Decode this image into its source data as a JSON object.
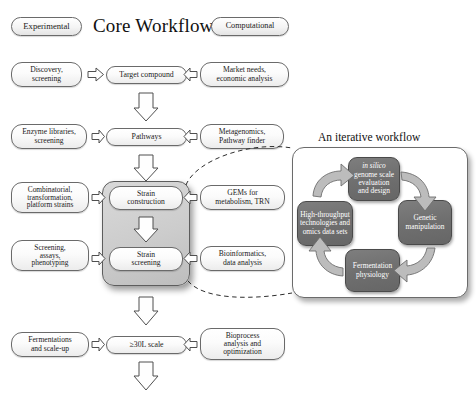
{
  "header": {
    "title": "Core Workflow",
    "left_badge": "Experimental",
    "right_badge": "Computational"
  },
  "panel": {
    "title": "An iterative workflow"
  },
  "rows": [
    {
      "left": "Discovery,\nscreening",
      "center": "Target compound",
      "right": "Market needs,\neconomic analysis"
    },
    {
      "left": "Enzyme libraries,\nscreening",
      "center": "Pathways",
      "right": "Metagenomics,\nPathway finder"
    },
    {
      "left": "Combinatorial,\ntransformation,\nplatform strains",
      "center": "Strain\nconstruction",
      "right": "GEMs for\nmetabolism, TRN"
    },
    {
      "left": "Screening,\nassays,\nphenotyping",
      "center": "Strain\nscreening",
      "right": "Bioinformatics,\ndata analysis"
    },
    {
      "left": "Fermentations\nand scale-up",
      "center": "≥30L scale",
      "right": "Bioprocess\nanalysis and\noptimization"
    }
  ],
  "cycle": {
    "top": "in silico\ngenome scale\nevaluation\nand design",
    "top_italic_prefix": "in silico",
    "right": "Genetic\nmanipulation",
    "bottom": "Fermentation\nphysiology",
    "left": "High-throughput\ntechnologies and\nomics data sets"
  },
  "colors": {
    "node_fill": "#ffffff",
    "node_stroke": "#6a6a6a",
    "grey_container": "#cccccc",
    "cycle_node": "#6f6f6f",
    "cycle_text": "#ffffff",
    "arrow_fill": "#ffffff",
    "arrow_stroke": "#555555",
    "cycle_arrow_fill": "#bdbdbd",
    "dashed_line": "#333333",
    "page_background": "#ffffff"
  }
}
